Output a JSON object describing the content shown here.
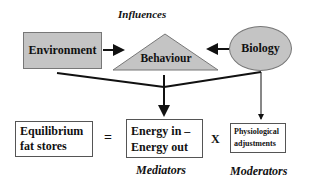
{
  "title": "Influences",
  "influences": {
    "environment": "Environment",
    "behaviour": "Behaviour",
    "biology": "Biology"
  },
  "equation": {
    "left_line1": "Equilibrium",
    "left_line2": "fat stores",
    "equals": "=",
    "middle_line1": "Energy in –",
    "middle_line2": "Energy out",
    "times": "X",
    "right_line1": "Physiological",
    "right_line2": "adjustments"
  },
  "labels": {
    "mediators": "Mediators",
    "moderators": "Moderators"
  },
  "colors": {
    "shape_fill": "#c4c4c4",
    "line": "#111111"
  }
}
